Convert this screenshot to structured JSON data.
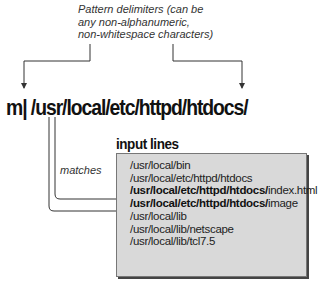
{
  "annotation": {
    "line1": "Pattern delimiters (can be",
    "line2": "any non-alphanumeric,",
    "line3": "non-whitespace characters)"
  },
  "command": "m| /usr/local/etc/httpd/htdocs/",
  "input_title": "input lines",
  "matches_label": "matches",
  "input_lines": [
    {
      "bold": "",
      "text": "/usr/local/bin"
    },
    {
      "bold": "",
      "text": "/usr/local/etc/httpd/htdocs"
    },
    {
      "bold": "/usr/local/etc/httpd/htdocs/",
      "text": "index.html"
    },
    {
      "bold": "/usr/local/etc/httpd/htdocs/",
      "text": "image"
    },
    {
      "bold": "",
      "text": "/usr/local/lib"
    },
    {
      "bold": "",
      "text": "/usr/local/lib/netscape"
    },
    {
      "bold": "",
      "text": "/usr/local/lib/tcl7.5"
    }
  ],
  "colors": {
    "box_fill": "#d9d9d9",
    "line": "#333333"
  }
}
